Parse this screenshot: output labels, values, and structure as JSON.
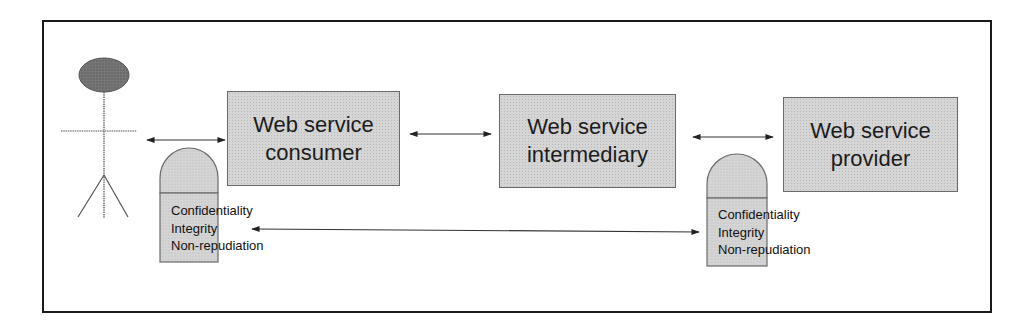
{
  "diagram": {
    "actor": {
      "label": "User (stick figure)"
    },
    "nodes": [
      {
        "id": "consumer",
        "line1": "Web service",
        "line2": "consumer"
      },
      {
        "id": "intermediary",
        "line1": "Web service",
        "line2": "intermediary"
      },
      {
        "id": "provider",
        "line1": "Web service",
        "line2": "provider"
      }
    ],
    "shields": [
      {
        "id": "consumer-shield",
        "lines": [
          "Confidentiality",
          "Integrity",
          "Non-repudiation"
        ]
      },
      {
        "id": "provider-shield",
        "lines": [
          "Confidentiality",
          "Integrity",
          "Non-repudiation"
        ]
      }
    ],
    "edges": [
      {
        "from": "actor",
        "to": "consumer",
        "type": "bidirectional"
      },
      {
        "from": "consumer",
        "to": "intermediary",
        "type": "bidirectional"
      },
      {
        "from": "intermediary",
        "to": "provider",
        "type": "bidirectional"
      },
      {
        "from": "consumer-shield",
        "to": "provider-shield",
        "type": "bidirectional"
      }
    ],
    "colors": {
      "box_fill": "#d5d5d5",
      "box_border": "#6a6a6a",
      "head_fill": "#6e6e6e",
      "line": "#333333",
      "frame": "#1a1a1a"
    }
  }
}
